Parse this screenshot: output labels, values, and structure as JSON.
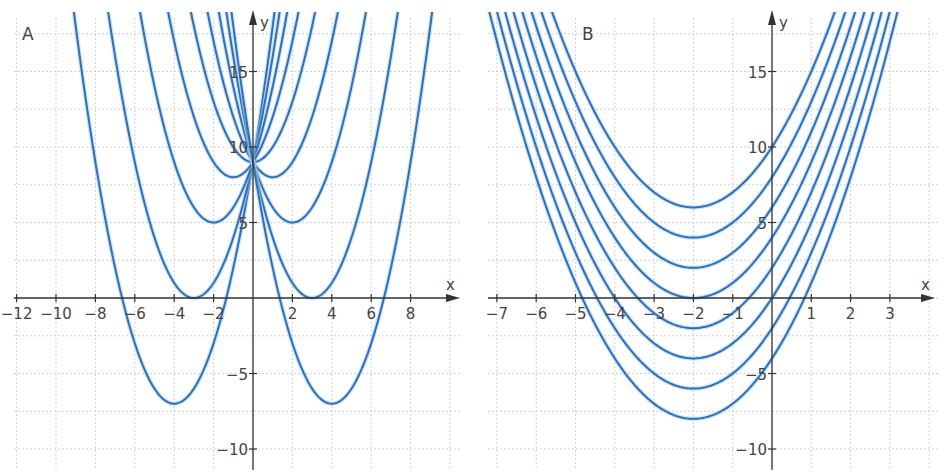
{
  "chart_data": [
    {
      "type": "line",
      "panel": "A",
      "title": "A",
      "description": "Family of parabolas y = x^2 - 2ax + 9 (vertex (a, 9 - a^2)), all passing through (0, 9)",
      "xlabel": "x",
      "ylabel": "y",
      "xlim": [
        -12.5,
        10.5
      ],
      "ylim": [
        -11,
        18.5
      ],
      "grid": true,
      "x_ticks": [
        -12,
        -10,
        -8,
        -6,
        -4,
        -2,
        2,
        4,
        6,
        8
      ],
      "x_tick_labels": [
        "−12",
        "−10",
        "−8",
        "−6",
        "−4",
        "−2",
        "2",
        "4",
        "6",
        "8"
      ],
      "y_ticks": [
        -10,
        -5,
        5,
        10,
        15
      ],
      "y_tick_labels": [
        "−10",
        "−5",
        "5",
        "10",
        "15"
      ],
      "x_grid_step": 2,
      "y_grid_step": 2.5,
      "series": [
        {
          "name": "a=-4",
          "vertex": [
            -4,
            -7
          ],
          "a": 1,
          "h": -4,
          "k": -7
        },
        {
          "name": "a=-3",
          "vertex": [
            -3,
            0
          ],
          "a": 1,
          "h": -3,
          "k": 0
        },
        {
          "name": "a=-2",
          "vertex": [
            -2,
            5
          ],
          "a": 1,
          "h": -2,
          "k": 5
        },
        {
          "name": "a=-1",
          "vertex": [
            -1,
            8
          ],
          "a": 1,
          "h": -1,
          "k": 8
        },
        {
          "name": "a=0",
          "vertex": [
            0,
            9
          ],
          "a": 1,
          "h": 0,
          "k": 9
        },
        {
          "name": "a=1",
          "vertex": [
            1,
            8
          ],
          "a": 1,
          "h": 1,
          "k": 8
        },
        {
          "name": "a=2",
          "vertex": [
            2,
            5
          ],
          "a": 1,
          "h": 2,
          "k": 5
        },
        {
          "name": "a=3",
          "vertex": [
            3,
            0
          ],
          "a": 1,
          "h": 3,
          "k": 0
        },
        {
          "name": "a=4",
          "vertex": [
            4,
            -7
          ],
          "a": 1,
          "h": 4,
          "k": -7
        }
      ],
      "layout": {
        "x0_px": 253,
        "y0_px": 298,
        "px_per_x": 19.7,
        "px_per_y": 15.1,
        "left": 12,
        "right": 460,
        "top": 12,
        "bottom": 470
      }
    },
    {
      "type": "line",
      "panel": "B",
      "title": "B",
      "description": "Family of parabolas y = (x + 2)^2 + c, vertices at (-2, c)",
      "xlabel": "x",
      "ylabel": "y",
      "xlim": [
        -7.5,
        4.2
      ],
      "ylim": [
        -11,
        18.5
      ],
      "grid": true,
      "x_ticks": [
        -7,
        -6,
        -5,
        -4,
        -3,
        -2,
        -1,
        1,
        2,
        3
      ],
      "x_tick_labels": [
        "−7",
        "−6",
        "−5",
        "−4",
        "−3",
        "−2",
        "−1",
        "1",
        "2",
        "3"
      ],
      "y_ticks": [
        -10,
        -5,
        5,
        10,
        15
      ],
      "y_tick_labels": [
        "−10",
        "−5",
        "5",
        "10",
        "15"
      ],
      "x_grid_step": 1,
      "y_grid_step": 2.5,
      "series": [
        {
          "name": "c=6",
          "vertex": [
            -2,
            6
          ],
          "a": 1,
          "h": -2,
          "k": 6
        },
        {
          "name": "c=4",
          "vertex": [
            -2,
            4
          ],
          "a": 1,
          "h": -2,
          "k": 4
        },
        {
          "name": "c=2",
          "vertex": [
            -2,
            2
          ],
          "a": 1,
          "h": -2,
          "k": 2
        },
        {
          "name": "c=0",
          "vertex": [
            -2,
            0
          ],
          "a": 1,
          "h": -2,
          "k": 0
        },
        {
          "name": "c=-2",
          "vertex": [
            -2,
            -2
          ],
          "a": 1,
          "h": -2,
          "k": -2
        },
        {
          "name": "c=-4",
          "vertex": [
            -2,
            -4
          ],
          "a": 1,
          "h": -2,
          "k": -4
        },
        {
          "name": "c=-6",
          "vertex": [
            -2,
            -6
          ],
          "a": 1,
          "h": -2,
          "k": -6
        },
        {
          "name": "c=-8",
          "vertex": [
            -2,
            -8
          ],
          "a": 1,
          "h": -2,
          "k": -8
        }
      ],
      "layout": {
        "x0_px": 772,
        "y0_px": 298,
        "px_per_x": 39.3,
        "px_per_y": 15.1,
        "left": 486,
        "right": 938,
        "top": 12,
        "bottom": 470
      }
    }
  ],
  "colors": {
    "curve": "#2f6fb3",
    "curve_glow": "#a9cdf0",
    "axis": "#333333",
    "grid": "#c8c8c8",
    "text": "#444444"
  }
}
